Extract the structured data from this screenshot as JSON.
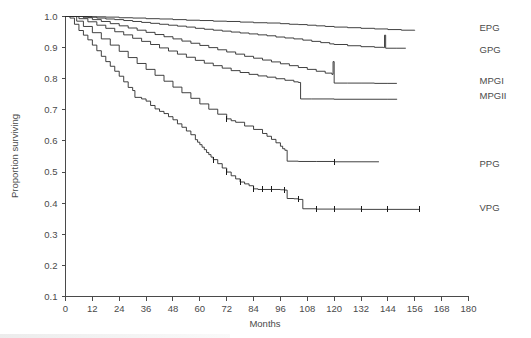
{
  "chart_data": {
    "type": "line",
    "title": "",
    "xlabel": "Months",
    "ylabel": "Proportion surviving",
    "xlim": [
      0,
      180
    ],
    "ylim": [
      0.1,
      1.0
    ],
    "grid": false,
    "legend_position": "right-inline-labels",
    "xticks": [
      0,
      12,
      24,
      36,
      48,
      60,
      72,
      84,
      96,
      108,
      120,
      132,
      144,
      156,
      168,
      180
    ],
    "xtick_labels": [
      "0",
      "12",
      "24",
      "36",
      "48",
      "60",
      "72",
      "84",
      "96",
      "108",
      "120",
      "132",
      "144",
      "156",
      "168",
      "180"
    ],
    "yticks": [
      0.1,
      0.2,
      0.3,
      0.4,
      0.5,
      0.6,
      0.7,
      0.8,
      0.9,
      1.0
    ],
    "ytick_labels": [
      "0.1",
      "0.2",
      "0.3",
      "0.4",
      "0.5",
      "0.6",
      "0.7",
      "0.8",
      "0.9",
      "1.0"
    ],
    "series": [
      {
        "name": "EPG",
        "label": "EPG",
        "label_y": 0.963,
        "end_x": 156,
        "end_y": 0.955,
        "points": [
          [
            0,
            1.0
          ],
          [
            8,
            1.0
          ],
          [
            12,
            0.999
          ],
          [
            18,
            0.998
          ],
          [
            24,
            0.996
          ],
          [
            30,
            0.995
          ],
          [
            36,
            0.993
          ],
          [
            42,
            0.992
          ],
          [
            48,
            0.99
          ],
          [
            54,
            0.988
          ],
          [
            60,
            0.987
          ],
          [
            66,
            0.985
          ],
          [
            72,
            0.984
          ],
          [
            78,
            0.982
          ],
          [
            84,
            0.98
          ],
          [
            90,
            0.979
          ],
          [
            96,
            0.977
          ],
          [
            100,
            0.975
          ],
          [
            104,
            0.974
          ],
          [
            108,
            0.972
          ],
          [
            112,
            0.97
          ],
          [
            116,
            0.968
          ],
          [
            120,
            0.966
          ],
          [
            126,
            0.964
          ],
          [
            132,
            0.962
          ],
          [
            138,
            0.96
          ],
          [
            144,
            0.958
          ],
          [
            150,
            0.956
          ],
          [
            156,
            0.955
          ]
        ],
        "censor_x": []
      },
      {
        "name": "GPG",
        "label": "GPG",
        "label_y": 0.894,
        "end_x": 152,
        "end_y": 0.898,
        "points": [
          [
            0,
            1.0
          ],
          [
            6,
            1.0
          ],
          [
            10,
            0.998
          ],
          [
            14,
            0.995
          ],
          [
            18,
            0.992
          ],
          [
            22,
            0.99
          ],
          [
            26,
            0.987
          ],
          [
            30,
            0.984
          ],
          [
            34,
            0.981
          ],
          [
            38,
            0.978
          ],
          [
            42,
            0.975
          ],
          [
            46,
            0.972
          ],
          [
            50,
            0.969
          ],
          [
            54,
            0.966
          ],
          [
            58,
            0.962
          ],
          [
            62,
            0.959
          ],
          [
            66,
            0.956
          ],
          [
            70,
            0.953
          ],
          [
            74,
            0.95
          ],
          [
            78,
            0.947
          ],
          [
            82,
            0.944
          ],
          [
            86,
            0.941
          ],
          [
            90,
            0.938
          ],
          [
            94,
            0.934
          ],
          [
            98,
            0.931
          ],
          [
            102,
            0.928
          ],
          [
            106,
            0.924
          ],
          [
            110,
            0.92
          ],
          [
            114,
            0.916
          ],
          [
            118,
            0.912
          ],
          [
            120,
            0.91
          ],
          [
            126,
            0.906
          ],
          [
            132,
            0.903
          ],
          [
            138,
            0.901
          ],
          [
            142,
            0.9
          ],
          [
            142.5,
            0.94
          ],
          [
            143,
            0.898
          ],
          [
            148,
            0.898
          ],
          [
            152,
            0.898
          ]
        ],
        "censor_x": []
      },
      {
        "name": "MPGI",
        "label": "MPGI",
        "label_y": 0.794,
        "end_x": 148,
        "end_y": 0.785,
        "points": [
          [
            0,
            1.0
          ],
          [
            4,
            1.0
          ],
          [
            8,
            0.996
          ],
          [
            12,
            0.99
          ],
          [
            16,
            0.984
          ],
          [
            20,
            0.977
          ],
          [
            24,
            0.97
          ],
          [
            28,
            0.963
          ],
          [
            32,
            0.956
          ],
          [
            36,
            0.949
          ],
          [
            40,
            0.942
          ],
          [
            44,
            0.935
          ],
          [
            48,
            0.928
          ],
          [
            52,
            0.921
          ],
          [
            56,
            0.914
          ],
          [
            60,
            0.907
          ],
          [
            64,
            0.9
          ],
          [
            68,
            0.893
          ],
          [
            72,
            0.886
          ],
          [
            76,
            0.879
          ],
          [
            80,
            0.872
          ],
          [
            84,
            0.866
          ],
          [
            88,
            0.86
          ],
          [
            92,
            0.854
          ],
          [
            96,
            0.848
          ],
          [
            100,
            0.842
          ],
          [
            104,
            0.836
          ],
          [
            108,
            0.83
          ],
          [
            112,
            0.824
          ],
          [
            116,
            0.818
          ],
          [
            119,
            0.814
          ],
          [
            119.5,
            0.855
          ],
          [
            120,
            0.786
          ],
          [
            126,
            0.786
          ],
          [
            132,
            0.786
          ],
          [
            138,
            0.785
          ],
          [
            144,
            0.785
          ],
          [
            148,
            0.785
          ]
        ],
        "censor_x": []
      },
      {
        "name": "MPGII",
        "label": "MPGII",
        "label_y": 0.745,
        "end_x": 148,
        "end_y": 0.735,
        "points": [
          [
            0,
            1.0
          ],
          [
            3,
            1.0
          ],
          [
            6,
            0.993
          ],
          [
            10,
            0.983
          ],
          [
            14,
            0.972
          ],
          [
            18,
            0.962
          ],
          [
            22,
            0.951
          ],
          [
            26,
            0.941
          ],
          [
            30,
            0.93
          ],
          [
            34,
            0.92
          ],
          [
            38,
            0.91
          ],
          [
            42,
            0.899
          ],
          [
            46,
            0.889
          ],
          [
            50,
            0.879
          ],
          [
            54,
            0.869
          ],
          [
            58,
            0.859
          ],
          [
            62,
            0.85
          ],
          [
            66,
            0.842
          ],
          [
            70,
            0.834
          ],
          [
            74,
            0.826
          ],
          [
            78,
            0.82
          ],
          [
            82,
            0.814
          ],
          [
            86,
            0.809
          ],
          [
            90,
            0.805
          ],
          [
            94,
            0.8
          ],
          [
            98,
            0.795
          ],
          [
            102,
            0.79
          ],
          [
            104,
            0.788
          ],
          [
            105,
            0.735
          ],
          [
            110,
            0.735
          ],
          [
            120,
            0.734
          ],
          [
            132,
            0.734
          ],
          [
            144,
            0.734
          ],
          [
            148,
            0.735
          ]
        ],
        "censor_x": []
      },
      {
        "name": "PPG",
        "label": "PPG",
        "label_y": 0.528,
        "end_x": 140,
        "end_y": 0.533,
        "points": [
          [
            0,
            1.0
          ],
          [
            2,
            1.0
          ],
          [
            5,
            0.985
          ],
          [
            8,
            0.968
          ],
          [
            12,
            0.948
          ],
          [
            16,
            0.928
          ],
          [
            20,
            0.908
          ],
          [
            24,
            0.888
          ],
          [
            28,
            0.868
          ],
          [
            32,
            0.849
          ],
          [
            36,
            0.83
          ],
          [
            40,
            0.811
          ],
          [
            44,
            0.792
          ],
          [
            48,
            0.773
          ],
          [
            52,
            0.755
          ],
          [
            56,
            0.737
          ],
          [
            60,
            0.719
          ],
          [
            64,
            0.702
          ],
          [
            68,
            0.686
          ],
          [
            72,
            0.671
          ],
          [
            74,
            0.665
          ],
          [
            76,
            0.66
          ],
          [
            80,
            0.648
          ],
          [
            84,
            0.637
          ],
          [
            88,
            0.624
          ],
          [
            90,
            0.615
          ],
          [
            92,
            0.605
          ],
          [
            94,
            0.594
          ],
          [
            96,
            0.583
          ],
          [
            97,
            0.575
          ],
          [
            98,
            0.57
          ],
          [
            99,
            0.535
          ],
          [
            104,
            0.534
          ],
          [
            112,
            0.534
          ],
          [
            120,
            0.533
          ],
          [
            132,
            0.533
          ],
          [
            140,
            0.533
          ]
        ],
        "censor_x": [
          72,
          120
        ]
      },
      {
        "name": "VPG",
        "label": "VPG",
        "label_y": 0.385,
        "end_x": 158,
        "end_y": 0.38,
        "points": [
          [
            0,
            1.0
          ],
          [
            2,
            0.995
          ],
          [
            4,
            0.975
          ],
          [
            6,
            0.955
          ],
          [
            8,
            0.94
          ],
          [
            10,
            0.925
          ],
          [
            12,
            0.908
          ],
          [
            14,
            0.89
          ],
          [
            16,
            0.872
          ],
          [
            18,
            0.855
          ],
          [
            20,
            0.84
          ],
          [
            22,
            0.824
          ],
          [
            24,
            0.808
          ],
          [
            26,
            0.79
          ],
          [
            28,
            0.772
          ],
          [
            30,
            0.762
          ],
          [
            31,
            0.74
          ],
          [
            34,
            0.735
          ],
          [
            36,
            0.728
          ],
          [
            38,
            0.714
          ],
          [
            40,
            0.703
          ],
          [
            42,
            0.695
          ],
          [
            44,
            0.688
          ],
          [
            46,
            0.678
          ],
          [
            48,
            0.668
          ],
          [
            50,
            0.655
          ],
          [
            52,
            0.644
          ],
          [
            54,
            0.632
          ],
          [
            56,
            0.62
          ],
          [
            58,
            0.604
          ],
          [
            59,
            0.596
          ],
          [
            60,
            0.588
          ],
          [
            61,
            0.58
          ],
          [
            62,
            0.572
          ],
          [
            63,
            0.563
          ],
          [
            64,
            0.556
          ],
          [
            65,
            0.548
          ],
          [
            66,
            0.54
          ],
          [
            68,
            0.527
          ],
          [
            70,
            0.513
          ],
          [
            72,
            0.5
          ],
          [
            74,
            0.488
          ],
          [
            76,
            0.478
          ],
          [
            78,
            0.468
          ],
          [
            80,
            0.462
          ],
          [
            82,
            0.456
          ],
          [
            84,
            0.446
          ],
          [
            86,
            0.444
          ],
          [
            88,
            0.444
          ],
          [
            92,
            0.444
          ],
          [
            96,
            0.443
          ],
          [
            98,
            0.442
          ],
          [
            99,
            0.415
          ],
          [
            102,
            0.414
          ],
          [
            104,
            0.412
          ],
          [
            106,
            0.382
          ],
          [
            112,
            0.381
          ],
          [
            120,
            0.381
          ],
          [
            132,
            0.38
          ],
          [
            144,
            0.38
          ],
          [
            158,
            0.38
          ]
        ],
        "censor_x": [
          66,
          72,
          78,
          84,
          88,
          92,
          98,
          104,
          112,
          120,
          132,
          144,
          158
        ]
      }
    ]
  },
  "axis": {
    "x_title": "Months",
    "y_title": "Proportion surviving"
  }
}
